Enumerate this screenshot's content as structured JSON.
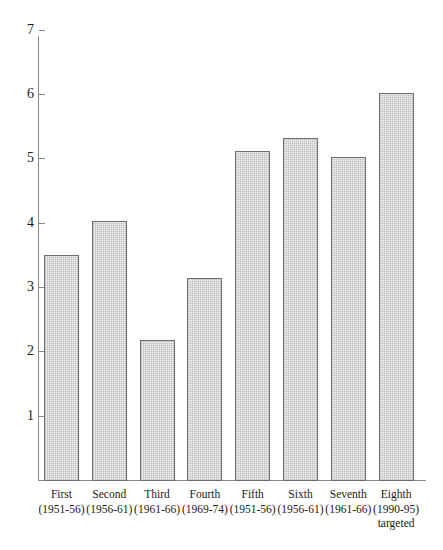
{
  "chart_data": {
    "type": "bar",
    "title": "",
    "subtitle": "",
    "xlabel": "",
    "ylabel": "",
    "ylim": [
      0,
      7
    ],
    "yticks": [
      1,
      2,
      3,
      4,
      5,
      6,
      7
    ],
    "ytick_labels": [
      "1",
      "2",
      "3",
      "4",
      "5",
      "6",
      "7"
    ],
    "grid": false,
    "legend": false,
    "legend_position": "none",
    "categories": [
      "First (1951-56)",
      "Second (1956-61)",
      "Third (1961-66)",
      "Fourth (1969-74)",
      "Fifth (1951-56)",
      "Sixth (1956-61)",
      "Seventh (1961-66)",
      "Eighth (1990-95) targeted"
    ],
    "values": [
      3.5,
      4.03,
      2.17,
      3.14,
      5.11,
      5.31,
      5.02,
      6.02
    ],
    "bar_fill_color": "#f2f2f2",
    "bar_edge_color": "#6e6e6e",
    "axis_color": "#8a8a8a",
    "background_color": "#ffffff"
  },
  "axis": {
    "ticks": [
      {
        "value": 7,
        "label": "7"
      },
      {
        "value": 6,
        "label": "6"
      },
      {
        "value": 5,
        "label": "5"
      },
      {
        "value": 4,
        "label": "4"
      },
      {
        "value": 3,
        "label": "3"
      },
      {
        "value": 2,
        "label": "2"
      },
      {
        "value": 1,
        "label": "1"
      }
    ]
  },
  "bars": [
    {
      "name": "First",
      "years": "(1951-56)",
      "note": "",
      "value": 3.5
    },
    {
      "name": "Second",
      "years": "(1956-61)",
      "note": "",
      "value": 4.03
    },
    {
      "name": "Third",
      "years": "(1961-66)",
      "note": "",
      "value": 2.17
    },
    {
      "name": "Fourth",
      "years": "(1969-74)",
      "note": "",
      "value": 3.14
    },
    {
      "name": "Fifth",
      "years": "(1951-56)",
      "note": "",
      "value": 5.11
    },
    {
      "name": "Sixth",
      "years": "(1956-61)",
      "note": "",
      "value": 5.31
    },
    {
      "name": "Seventh",
      "years": "(1961-66)",
      "note": "",
      "value": 5.02
    },
    {
      "name": "Eighth",
      "years": "(1990-95)",
      "note": "targeted",
      "value": 6.02
    }
  ]
}
